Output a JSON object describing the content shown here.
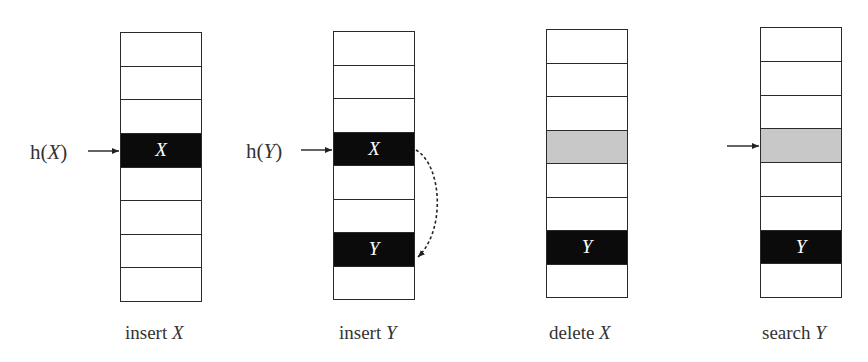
{
  "diagram": {
    "colors": {
      "filled": "#0b0b0b",
      "deleted": "#c8c8c8",
      "empty": "#ffffff",
      "border": "#2a2a2a"
    },
    "panels": [
      {
        "id": "insert-x",
        "caption_verb": "insert",
        "caption_var": "X",
        "hash_label_prefix": "h(",
        "hash_label_var": "X",
        "hash_label_suffix": ")",
        "pointer_row": 3,
        "cells": [
          {
            "state": "empty",
            "label": ""
          },
          {
            "state": "empty",
            "label": ""
          },
          {
            "state": "empty",
            "label": ""
          },
          {
            "state": "filled",
            "label": "X"
          },
          {
            "state": "empty",
            "label": ""
          },
          {
            "state": "empty",
            "label": ""
          },
          {
            "state": "empty",
            "label": ""
          },
          {
            "state": "empty",
            "label": ""
          }
        ]
      },
      {
        "id": "insert-y",
        "caption_verb": "insert",
        "caption_var": "Y",
        "hash_label_prefix": "h(",
        "hash_label_var": "Y",
        "hash_label_suffix": ")",
        "pointer_row": 3,
        "probe_from_row": 3,
        "probe_to_row": 6,
        "cells": [
          {
            "state": "empty",
            "label": ""
          },
          {
            "state": "empty",
            "label": ""
          },
          {
            "state": "empty",
            "label": ""
          },
          {
            "state": "filled",
            "label": "X"
          },
          {
            "state": "empty",
            "label": ""
          },
          {
            "state": "empty",
            "label": ""
          },
          {
            "state": "filled",
            "label": "Y"
          },
          {
            "state": "empty",
            "label": ""
          }
        ]
      },
      {
        "id": "delete-x",
        "caption_verb": "delete",
        "caption_var": "X",
        "cells": [
          {
            "state": "empty",
            "label": ""
          },
          {
            "state": "empty",
            "label": ""
          },
          {
            "state": "empty",
            "label": ""
          },
          {
            "state": "deleted",
            "label": ""
          },
          {
            "state": "empty",
            "label": ""
          },
          {
            "state": "empty",
            "label": ""
          },
          {
            "state": "filled",
            "label": "Y"
          },
          {
            "state": "empty",
            "label": ""
          }
        ]
      },
      {
        "id": "search-y",
        "caption_verb": "search",
        "caption_var": "Y",
        "pointer_row": 3,
        "cells": [
          {
            "state": "empty",
            "label": ""
          },
          {
            "state": "empty",
            "label": ""
          },
          {
            "state": "empty",
            "label": ""
          },
          {
            "state": "deleted",
            "label": ""
          },
          {
            "state": "empty",
            "label": ""
          },
          {
            "state": "empty",
            "label": ""
          },
          {
            "state": "filled",
            "label": "Y"
          },
          {
            "state": "empty",
            "label": ""
          }
        ]
      }
    ]
  }
}
